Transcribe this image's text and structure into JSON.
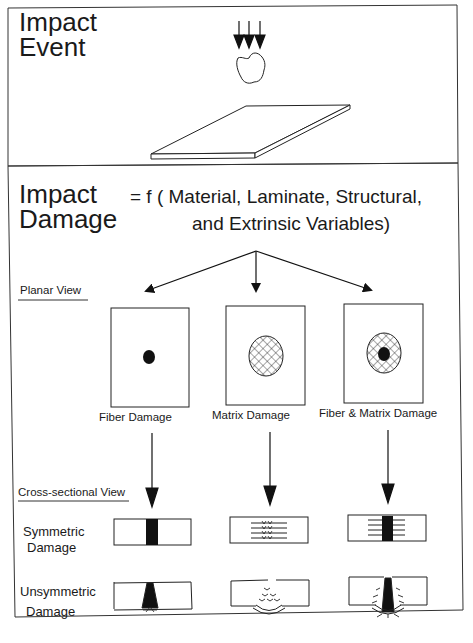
{
  "top_panel": {
    "title_line1": "Impact",
    "title_line2": "Event",
    "elements": [
      "impact-arrows-icon",
      "impactor-icon",
      "plate-icon"
    ]
  },
  "bottom_panel": {
    "title_line1": "Impact",
    "title_line2": "Damage",
    "formula_line1": "= f ( Material, Laminate, Structural,",
    "formula_line2": "and Extrinsic  Variables)"
  },
  "planar_view": {
    "heading": "Planar View",
    "panels": [
      {
        "label": "Fiber Damage",
        "pattern": "solid-dot"
      },
      {
        "label": "Matrix Damage",
        "pattern": "crosshatch-ellipse"
      },
      {
        "label": "Fiber & Matrix Damage",
        "pattern": "crosshatch-ellipse-with-dot"
      }
    ]
  },
  "cross_sectional_view": {
    "heading": "Cross-sectional View",
    "rows": [
      {
        "label_line1": "Symmetric",
        "label_line2": "Damage"
      },
      {
        "label_line1": "Unsymmetric",
        "label_line2": "Damage"
      }
    ]
  },
  "colors": {
    "ink": "#111111",
    "background": "#ffffff"
  }
}
